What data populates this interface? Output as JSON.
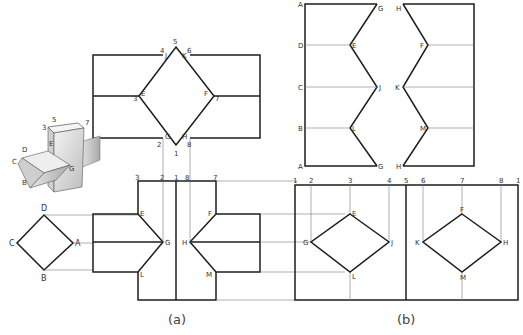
{
  "figure": {
    "captions": {
      "a": "(a)",
      "b": "(b)"
    },
    "top_view": {
      "labels": {
        "p5": "5",
        "p4": "4",
        "pJ": "J",
        "pK": "K",
        "p6": "6",
        "p3": "3",
        "pE": "E",
        "pF": "F",
        "p7": "7",
        "p2": "2",
        "pG": "G",
        "pH": "H",
        "p8": "8",
        "p1": "1"
      }
    },
    "pictorial": {
      "labels": {
        "p5": "5",
        "p3": "3",
        "p7": "7",
        "pE": "E",
        "pD": "D",
        "pC": "C",
        "pB": "B",
        "pG": "G"
      }
    },
    "end_view": {
      "labels": {
        "D": "D",
        "C": "C",
        "A": "A",
        "B": "B"
      }
    },
    "front_view": {
      "column_labels": {
        "c3": "3",
        "c2": "2",
        "c1": "1",
        "c8": "8",
        "c7": "7"
      },
      "labels": {
        "E": "E",
        "G": "G",
        "L": "L",
        "F": "F",
        "H": "H",
        "M": "M"
      }
    },
    "development_prism": {
      "left_labels": [
        "A",
        "D",
        "C",
        "B",
        "A"
      ],
      "inner_labels": {
        "G1": "G",
        "H1": "H",
        "E": "E",
        "F": "F",
        "J": "J",
        "K": "K",
        "L": "L",
        "M": "M",
        "G2": "G",
        "H2": "H"
      }
    },
    "development_column": {
      "column_labels": {
        "c1a": "1",
        "c2": "2",
        "c3": "3",
        "c4": "4",
        "c5": "5",
        "c6": "6",
        "c7": "7",
        "c8": "8",
        "c1b": "1"
      },
      "labels": {
        "E": "E",
        "G": "G",
        "J": "J",
        "L": "L",
        "F": "F",
        "K": "K",
        "H": "H",
        "M": "M"
      }
    }
  }
}
